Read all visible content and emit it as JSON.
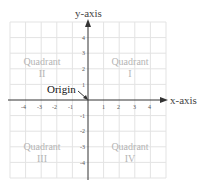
{
  "diagram": {
    "x_axis_label": "x-axis",
    "y_axis_label": "y-axis",
    "origin_label": "Origin",
    "x_ticks": [
      "-4",
      "-3",
      "-2",
      "-1",
      "1",
      "2",
      "3",
      "4"
    ],
    "y_ticks": [
      "4",
      "3",
      "2",
      "1",
      "-1",
      "-2",
      "-3",
      "-4"
    ],
    "quadrants": [
      {
        "id": "I",
        "word": "Quadrant",
        "numeral": "I"
      },
      {
        "id": "II",
        "word": "Quadrant",
        "numeral": "II"
      },
      {
        "id": "III",
        "word": "Quadrant",
        "numeral": "III"
      },
      {
        "id": "IV",
        "word": "Quadrant",
        "numeral": "IV"
      }
    ],
    "colors": {
      "grid": "#e3e3e3",
      "axis": "#333333",
      "quadrant_text": "#b5b5b5"
    }
  }
}
